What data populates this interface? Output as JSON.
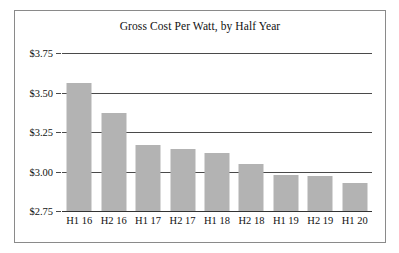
{
  "chart_data": {
    "type": "bar",
    "title": "Gross Cost Per Watt, by Half Year",
    "xlabel": "",
    "ylabel": "",
    "categories": [
      "H1 16",
      "H2 16",
      "H1 17",
      "H2 17",
      "H1 18",
      "H2 18",
      "H1 19",
      "H2 19",
      "H1 20"
    ],
    "values": [
      3.56,
      3.37,
      3.17,
      3.14,
      3.12,
      3.05,
      2.98,
      2.97,
      2.93
    ],
    "ylim": [
      2.75,
      3.75
    ],
    "ytick_labels": [
      "$3.75",
      "$3.50",
      "$3.25",
      "$3.00",
      "$2.75"
    ],
    "ytick_values": [
      3.75,
      3.5,
      3.25,
      3.0,
      2.75
    ],
    "grid": true,
    "legend": false,
    "bar_color": "#b3b3b3",
    "axis_color": "#4a4a4a",
    "frame_color": "#8a8a8a",
    "text_color": "#111111"
  }
}
